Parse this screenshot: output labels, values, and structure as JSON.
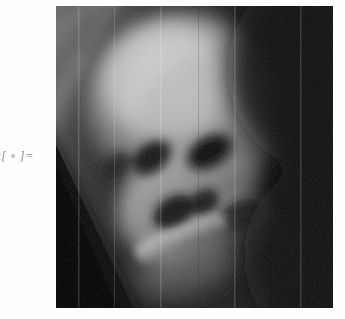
{
  "document": {
    "background_color": "#fefefe",
    "kind": "notebook-output-cell"
  },
  "output_cell": {
    "label_text": "ut[ ∘ ]=",
    "label_full_text": "Out[ ∘ ]=",
    "label_color": "#8e8e8e",
    "label_style": "italic",
    "clipped_at_left_edge": true
  },
  "graphic": {
    "alt": "grayscale anamorphic skull render",
    "x": 56,
    "y": 6,
    "width": 277,
    "height": 302,
    "color_mode": "grayscale",
    "palette": {
      "black": "#000000",
      "deep_shadow": "#0c0c0c",
      "shadow": "#242424",
      "mid_dark": "#3c3c3c",
      "mid": "#606060",
      "mid_light": "#8a8a8a",
      "light": "#b2b2b2",
      "highlight": "#d2d2d2",
      "bright": "#e2e2e2"
    },
    "features": [
      {
        "name": "cranium-highlight",
        "tone": "#d2d2d2"
      },
      {
        "name": "left-eye-socket",
        "tone": "#1e1e1e"
      },
      {
        "name": "right-eye-socket",
        "tone": "#1a1a1a"
      },
      {
        "name": "nasal-cavity",
        "tone": "#171717"
      },
      {
        "name": "upper-teeth-row",
        "tone": "#cfcfcf"
      },
      {
        "name": "jaw-shadow",
        "tone": "#2a2a2a"
      },
      {
        "name": "black-wedge-lower-left",
        "tone": "#000000"
      },
      {
        "name": "dark-background-right",
        "tone": "#141414"
      },
      {
        "name": "film-grain-noise",
        "tone": "#7a7a7a"
      }
    ]
  }
}
